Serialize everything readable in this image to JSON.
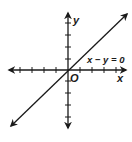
{
  "diagram": {
    "title": "",
    "axes": {
      "x_label": "x",
      "y_label": "y",
      "origin_label": "O",
      "ticks_per_side": 4
    },
    "line": {
      "equation": "x − y = 0",
      "slope": 1,
      "intercept": 0
    },
    "colors": {
      "stroke": "#1a1a1a",
      "background": "#ffffff"
    }
  }
}
